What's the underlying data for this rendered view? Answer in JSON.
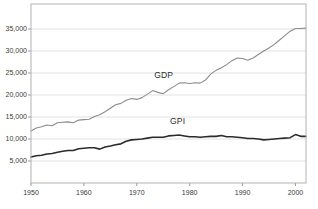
{
  "chart_data": {
    "type": "line",
    "title": "",
    "subtitle": "",
    "xlabel": "",
    "ylabel": "",
    "xlim": [
      1950,
      2002
    ],
    "ylim": [
      0,
      38000
    ],
    "grid": "horizontal",
    "legend_position": "inline-annotation",
    "y_ticks": [
      5000,
      10000,
      15000,
      20000,
      25000,
      30000,
      35000
    ],
    "y_tick_labels": [
      "5,000",
      "10,000",
      "15,000",
      "20,000",
      "25,000",
      "30,000",
      "35,000"
    ],
    "x_ticks": [
      1950,
      1960,
      1970,
      1980,
      1990,
      2000
    ],
    "x_tick_labels": [
      "1950",
      "1960",
      "1970",
      "1980",
      "1990",
      "2000"
    ],
    "annotations": [
      {
        "text": "GDP",
        "x": 1975,
        "y": 24600
      },
      {
        "text": "GPI",
        "x": 1978,
        "y": 14200
      }
    ],
    "series": [
      {
        "name": "GDP",
        "color": "#8c8c8c",
        "width": 1.1,
        "x": [
          1950,
          1951,
          1952,
          1953,
          1954,
          1955,
          1956,
          1957,
          1958,
          1959,
          1960,
          1961,
          1962,
          1963,
          1964,
          1965,
          1966,
          1967,
          1968,
          1969,
          1970,
          1971,
          1972,
          1973,
          1974,
          1975,
          1976,
          1977,
          1978,
          1979,
          1980,
          1981,
          1982,
          1983,
          1984,
          1985,
          1986,
          1987,
          1988,
          1989,
          1990,
          1991,
          1992,
          1993,
          1994,
          1995,
          1996,
          1997,
          1998,
          1999,
          2000,
          2001,
          2002
        ],
        "values": [
          11800,
          12500,
          12800,
          13200,
          13000,
          13700,
          13800,
          13900,
          13700,
          14300,
          14400,
          14500,
          15100,
          15500,
          16200,
          17000,
          17800,
          18100,
          18800,
          19200,
          19000,
          19400,
          20200,
          21000,
          20600,
          20300,
          21200,
          21900,
          22700,
          22800,
          22600,
          22800,
          22700,
          23400,
          24800,
          25600,
          26200,
          26900,
          27800,
          28400,
          28300,
          27900,
          28400,
          29200,
          30000,
          30700,
          31500,
          32500,
          33500,
          34500,
          35100,
          35100,
          35200
        ]
      },
      {
        "name": "GPI",
        "color": "#2b2b2b",
        "width": 1.6,
        "x": [
          1950,
          1951,
          1952,
          1953,
          1954,
          1955,
          1956,
          1957,
          1958,
          1959,
          1960,
          1961,
          1962,
          1963,
          1964,
          1965,
          1966,
          1967,
          1968,
          1969,
          1970,
          1971,
          1972,
          1973,
          1974,
          1975,
          1976,
          1977,
          1978,
          1979,
          1980,
          1981,
          1982,
          1983,
          1984,
          1985,
          1986,
          1987,
          1988,
          1989,
          1990,
          1991,
          1992,
          1993,
          1994,
          1995,
          1996,
          1997,
          1998,
          1999,
          2000,
          2001,
          2002
        ],
        "values": [
          5900,
          6200,
          6300,
          6600,
          6700,
          7000,
          7200,
          7400,
          7400,
          7800,
          7900,
          8000,
          8000,
          7700,
          8200,
          8400,
          8700,
          8900,
          9500,
          9800,
          9900,
          10000,
          10200,
          10400,
          10400,
          10400,
          10700,
          10800,
          10900,
          10700,
          10500,
          10500,
          10400,
          10500,
          10600,
          10600,
          10800,
          10500,
          10500,
          10400,
          10300,
          10100,
          10100,
          10000,
          9800,
          9900,
          10000,
          10100,
          10200,
          10300,
          11000,
          10600,
          10600
        ]
      }
    ]
  },
  "axes": {
    "frame_color": "#b2b2b2",
    "grid_color": "#e2e2e2",
    "tick_color": "#999999",
    "label_color": "#3a3a3a"
  },
  "geometry": {
    "plot_left": 31,
    "plot_right": 306,
    "plot_top": 4,
    "plot_bottom": 183,
    "x_min_year": 1950,
    "x_max_year": 2002,
    "y_min_value": 0,
    "y_max_value": 40682
  }
}
